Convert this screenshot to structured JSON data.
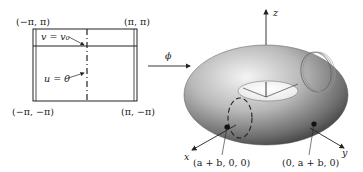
{
  "domain_panel_left": {
    "corners": {
      "top_left": "(−π, π)",
      "top_right": "(π, π)",
      "bottom_left": "(−π, −π)",
      "bottom_right": "(π, −π)"
    },
    "curve_labels": {
      "horizontal": "v = v₀",
      "vertical": "u = 0"
    }
  },
  "mapping": {
    "label": "ϕ"
  },
  "torus_panel_right": {
    "axes": {
      "x": "x",
      "y": "y",
      "z": "z"
    },
    "points": {
      "x_point": "(a + b, 0, 0)",
      "y_point": "(0, a + b, 0)"
    }
  }
}
